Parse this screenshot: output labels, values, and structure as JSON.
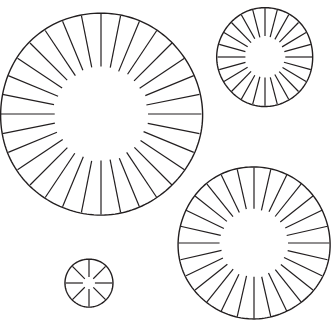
{
  "canvas": {
    "width": 334,
    "height": 336,
    "background_color": "#ffffff",
    "stroke_color": "#231f20",
    "title": "Radial spoke wheel diagram"
  },
  "figure": {
    "shape_count": 4,
    "style": {
      "outline_stroke_width": 1.4,
      "spoke_stroke_width": 1.2,
      "fill": "none"
    }
  },
  "shapes": [
    {
      "id": "wheel-large-top-left",
      "label": "Large spoke wheel (upper left)",
      "cx": 101,
      "cy": 114,
      "r_outer": 101,
      "r_inner": 47,
      "spokes": 32,
      "rotation_deg": 0,
      "ellipse_ry_factor": 1.0,
      "stroke_color": "#231f20"
    },
    {
      "id": "wheel-medium-top-right",
      "label": "Medium spoke wheel (upper right)",
      "cx": 265,
      "cy": 57,
      "r_outer": 48,
      "r_inner": 20,
      "spokes": 24,
      "rotation_deg": 0,
      "ellipse_ry_factor": 1.03,
      "stroke_color": "#231f20"
    },
    {
      "id": "wheel-large-bottom-right",
      "label": "Large spoke wheel (lower right)",
      "cx": 254,
      "cy": 243,
      "r_outer": 76,
      "r_inner": 34,
      "spokes": 28,
      "rotation_deg": 0,
      "ellipse_ry_factor": 1.0,
      "stroke_color": "#231f20"
    },
    {
      "id": "wheel-small-bottom-left",
      "label": "Small spoke wheel (lower left)",
      "cx": 89,
      "cy": 283,
      "r_outer": 24,
      "r_inner": 6,
      "spokes": 8,
      "rotation_deg": 0,
      "ellipse_ry_factor": 1.0,
      "stroke_color": "#231f20"
    }
  ]
}
